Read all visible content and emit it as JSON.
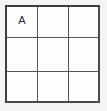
{
  "figure": {
    "kind": "3x3-grid",
    "rows": 3,
    "columns": 3,
    "background_color": "#f5f4f2",
    "cell_background_color": "#fdfdfc",
    "border_color": "#3d3d3d",
    "inner_line_color": "#555555",
    "label_color": "#2b2b2b"
  },
  "grid": {
    "cells": [
      {
        "id": "r1c1",
        "row": 1,
        "column": 1,
        "label": "A"
      },
      {
        "id": "r1c2",
        "row": 1,
        "column": 2,
        "label": ""
      },
      {
        "id": "r1c3",
        "row": 1,
        "column": 3,
        "label": ""
      },
      {
        "id": "r2c1",
        "row": 2,
        "column": 1,
        "label": ""
      },
      {
        "id": "r2c2",
        "row": 2,
        "column": 2,
        "label": ""
      },
      {
        "id": "r2c3",
        "row": 2,
        "column": 3,
        "label": ""
      },
      {
        "id": "r3c1",
        "row": 3,
        "column": 1,
        "label": ""
      },
      {
        "id": "r3c2",
        "row": 3,
        "column": 2,
        "label": ""
      },
      {
        "id": "r3c3",
        "row": 3,
        "column": 3,
        "label": ""
      }
    ]
  }
}
